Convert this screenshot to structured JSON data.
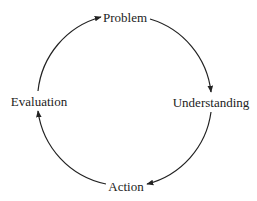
{
  "diagram": {
    "type": "cycle",
    "nodes": [
      {
        "id": "problem",
        "label": "Problem"
      },
      {
        "id": "understanding",
        "label": "Understanding"
      },
      {
        "id": "action",
        "label": "Action"
      },
      {
        "id": "evaluation",
        "label": "Evaluation"
      }
    ],
    "edges": [
      {
        "from": "problem",
        "to": "understanding",
        "direction": "clockwise"
      },
      {
        "from": "understanding",
        "to": "action",
        "direction": "clockwise"
      },
      {
        "from": "action",
        "to": "evaluation",
        "direction": "clockwise"
      },
      {
        "from": "evaluation",
        "to": "problem",
        "direction": "clockwise"
      }
    ],
    "colors": {
      "line": "#222222",
      "text": "#222222",
      "background": "#ffffff"
    }
  }
}
